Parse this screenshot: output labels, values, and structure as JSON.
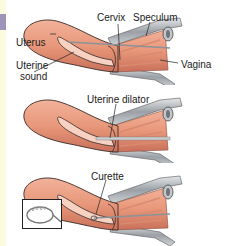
{
  "diagram": {
    "panels": [
      {
        "step": 1,
        "labels": {
          "uterus": "Uterus",
          "uterine_sound_line1": "Uterine",
          "uterine_sound_line2": "sound",
          "cervix": "Cervix",
          "speculum": "Speculum",
          "vagina": "Vagina"
        }
      },
      {
        "step": 2,
        "labels": {
          "uterine_dilator": "Uterine dilator"
        }
      },
      {
        "step": 3,
        "labels": {
          "curette": "Curette"
        },
        "inset": "curette-tip-detail"
      }
    ],
    "colors": {
      "tissue": "#e8977a",
      "tissue_dark": "#c86a50",
      "metal": "#a9aeb4",
      "outline": "#3a2a28",
      "accent_strip": "#9f93b9",
      "side_strip": "#fbfbe0"
    }
  }
}
